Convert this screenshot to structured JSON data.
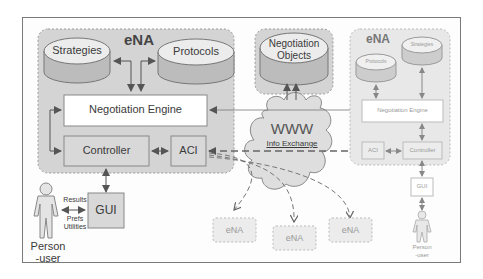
{
  "diagram": {
    "local_agent": {
      "title": "eNA",
      "strategies": "Strategies",
      "protocols": "Protocols",
      "negotiation_engine": "Negotiation Engine",
      "controller": "Controller",
      "aci": "ACI",
      "gui": "GUI",
      "person_line1": "Person",
      "person_line2": "-user",
      "results": "Results",
      "prefs": "Prefs",
      "utilities": "Utilities"
    },
    "shared": {
      "negotiation_objects_line1": "Negotiation",
      "negotiation_objects_line2": "Objects",
      "www": "WWW",
      "info_exchange": "Info Exchange"
    },
    "remote_agent": {
      "title": "eNA",
      "strategies": "Strategies",
      "protocols": "Protocols",
      "negotiation_engine": "Negotiation Engine",
      "aci": "ACI",
      "controller": "Controller",
      "gui": "GUI",
      "person_line1": "Person",
      "person_line2": "-user"
    },
    "other_agents": [
      {
        "label": "eNA"
      },
      {
        "label": "eNA"
      },
      {
        "label": "eNA"
      }
    ],
    "colors": {
      "container_fill": "#d6d6d6",
      "cylinder_top": "#ebebeb",
      "cylinder_body": "#bdbdbd",
      "box_fill": "#ffffff",
      "text": "#3a3a3a",
      "faded_text": "#8a8a8a"
    }
  }
}
